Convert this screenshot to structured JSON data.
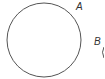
{
  "diagram": {
    "labels": {
      "a": "A",
      "b": "B"
    },
    "circle": {
      "cx": 44,
      "cy": 40,
      "r": 37,
      "stroke": "#555555"
    },
    "partial_shape": {
      "stroke": "#555555"
    }
  }
}
